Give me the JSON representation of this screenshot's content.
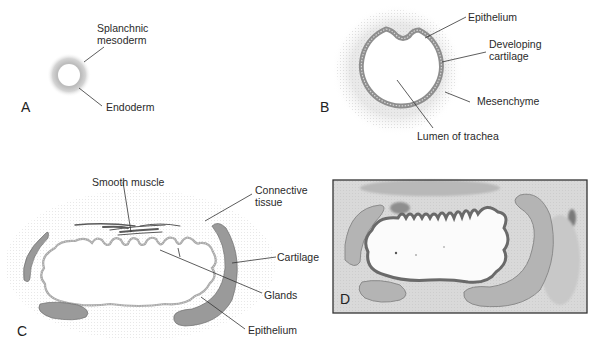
{
  "panels": {
    "A": {
      "letter": "A",
      "labels": {
        "splanchnic_line1": "Splanchnic",
        "splanchnic_line2": "mesoderm",
        "endoderm": "Endoderm"
      }
    },
    "B": {
      "letter": "B",
      "labels": {
        "epithelium": "Epithelium",
        "developing_line1": "Developing",
        "developing_line2": "cartilage",
        "mesenchyme": "Mesenchyme",
        "lumen": "Lumen of trachea"
      }
    },
    "C": {
      "letter": "C",
      "labels": {
        "smooth_muscle": "Smooth muscle",
        "connective_line1": "Connective",
        "connective_line2": "tissue",
        "cartilage": "Cartilage",
        "glands": "Glands",
        "epithelium": "Epithelium"
      }
    },
    "D": {
      "letter": "D",
      "description": "Histological section of trachea"
    }
  },
  "colors": {
    "cartilage": "#9a9a9a",
    "leader_line": "#333333",
    "mesenchyme_halo": "#e6e6e6",
    "histology_bg": "#d8d8d8"
  }
}
